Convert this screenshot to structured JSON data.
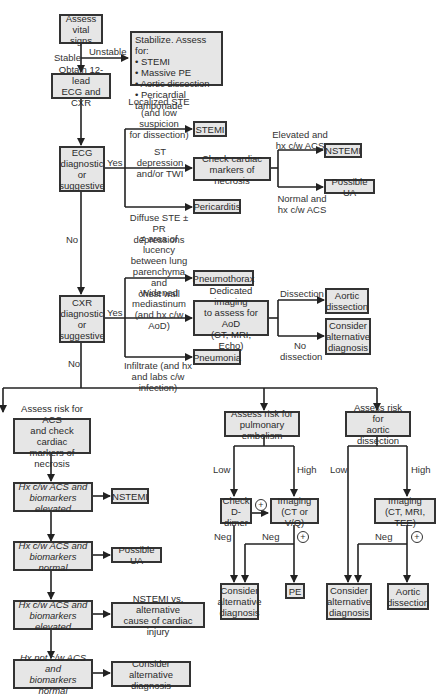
{
  "nodes": {
    "assess_vital": "Assess\nvital signs",
    "stabilize": "Stabilize. Assess for:\n• STEMI\n• Massive PE\n• Aortic dissection\n• Pericardial tamponade",
    "obtain_ecg": "Obtain 12-lead\nECG and CXR",
    "ecg_diag": "ECG\ndiagnostic\nor\nsuggestive",
    "stemi": "STEMI",
    "check_markers": "Check cardiac\nmarkers of necrosis",
    "nstemi_top": "NSTEMI",
    "possible_ua_top": "Possible UA",
    "pericarditis": "Pericarditis",
    "cxr_diag": "CXR\ndiagnostic\nor\nsuggestive",
    "pneumothorax": "Pneumothorax",
    "dedicated_imaging": "Dedicated imaging\nto assess for AoD\n(CT, MRI, Echo)",
    "aortic_dissection_top": "Aortic\ndissection",
    "consider_alt_top": "Consider\nalternative\ndiagnosis",
    "pneumonia": "Pneumonia",
    "assess_acs": "Assess risk for ACS\nand check cardiac\nmarkers of necrosis",
    "hx_acs_elev1": "Hx c/w ACS and\nbiomarkers elevated",
    "nstemi_low": "NSTEMI",
    "hx_acs_normal": "Hx c/w ACS and\nbiomarkers normal",
    "possible_ua_low": "Possible UA",
    "hx_acs_elev2": "Hx c/w ACS and\nbiomarkers elevated",
    "nstemi_vs": "NSTEMI vs. alternative\ncause of cardiac injury",
    "hx_not_acs": "Hx not c/w ACS and\nbiomarkers normal",
    "consider_alt_acs": "Consider alternative\ndiagnosis",
    "assess_pe": "Assess risk for\npulmonary embolism",
    "check_ddimer": "Check\nD-dimer",
    "imaging_pe": "Imaging\n(CT or V/Q)",
    "consider_alt_pe": "Consider\nalternative\ndiagnosis",
    "pe": "PE",
    "assess_aod": "Assess risk for\naortic dissection",
    "imaging_aod": "Imaging\n(CT, MRI, TEE)",
    "consider_alt_aod": "Consider\nalternative\ndiagnosis",
    "aortic_dissection_low": "Aortic\ndissection"
  },
  "labels": {
    "stable": "Stable",
    "unstable": "Unstable",
    "localized_ste": "Localized STE\n(and low suspicion\nfor dissection)",
    "ecg_yes": "Yes",
    "st_depression": "ST depression\nand/or TWI",
    "elevated_acs": "Elevated and\nhx c/w ACS",
    "normal_acs": "Normal and\nhx c/w ACS",
    "diffuse_ste": "Diffuse STE ±\nPR depressions",
    "ecg_no": "No",
    "lucency": "≠ area of lucency\nbetween lung\nparenchyma and\nchest wall",
    "widened": "Widened\nmediastinum\n(and hx c/w AoD)",
    "cxr_yes": "Yes",
    "dissection": "Dissection",
    "no_dissection": "No\ndissection",
    "infiltrate": "Infiltrate (and hx\nand labs c/w infection)",
    "cxr_no": "No",
    "pe_low": "Low",
    "pe_high": "High",
    "pe_neg1": "Neg",
    "pe_neg2": "Neg",
    "aod_low": "Low",
    "aod_high": "High",
    "aod_neg": "Neg",
    "plus": "+"
  }
}
